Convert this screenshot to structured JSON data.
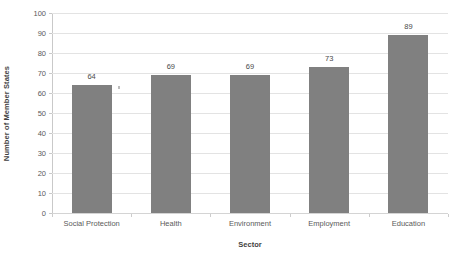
{
  "chart_data": {
    "type": "bar",
    "title": "",
    "subtitle": "",
    "xlabel": "Sector",
    "ylabel": "Number of Member States",
    "categories": [
      "Social Protection",
      "Health",
      "Environment",
      "Employment",
      "Education"
    ],
    "values": [
      64,
      69,
      69,
      73,
      89
    ],
    "data_labels": [
      "64",
      "69",
      "69",
      "73",
      "89"
    ],
    "ylim": [
      0,
      100
    ],
    "y_ticks": [
      0,
      10,
      20,
      30,
      40,
      50,
      60,
      70,
      80,
      90,
      100
    ],
    "y_tick_labels": [
      "0",
      "10",
      "20",
      "30",
      "40",
      "50",
      "60",
      "70",
      "80",
      "90",
      "100"
    ],
    "grid": true,
    "grid_axis": "y",
    "legend": false,
    "legend_position": "none",
    "series": [
      {
        "name": "Number of Member States",
        "values": [
          64,
          69,
          69,
          73,
          89
        ],
        "color": "#808080"
      }
    ],
    "colors": {
      "bar": "#808080",
      "gridline": "#e3e3e3",
      "axis": "#c9c9c9",
      "text": "#5a5a5a",
      "background": "#ffffff"
    },
    "annotations": []
  }
}
